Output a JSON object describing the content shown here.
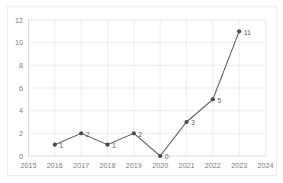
{
  "chart_data": {
    "type": "line",
    "title": "",
    "subtitle": "",
    "xlabel": "",
    "ylabel": "",
    "categories": [
      2016,
      2017,
      2018,
      2019,
      2020,
      2021,
      2022,
      2023
    ],
    "values": [
      1,
      2,
      1,
      2,
      0,
      3,
      5,
      11
    ],
    "point_labels": [
      "1",
      "2",
      "1",
      "2",
      "0",
      "3",
      "5",
      "11"
    ],
    "x_tick_labels": [
      "2015",
      "2016",
      "2017",
      "2018",
      "2019",
      "2020",
      "2021",
      "2022",
      "2023",
      "2024"
    ],
    "y_tick_labels": [
      "0",
      "2",
      "4",
      "6",
      "8",
      "10",
      "12"
    ],
    "xlim": [
      2015,
      2024
    ],
    "ylim": [
      0,
      12
    ],
    "y_tick_step": 2,
    "grid": {
      "horizontal": true,
      "vertical": true,
      "color": "#e6e6ea"
    },
    "legend": {
      "visible": false,
      "position": "none",
      "entries": []
    },
    "colors": {
      "background": "#ffffff",
      "line": "#606060",
      "marker": "#4c4c4c",
      "grid": "#e6e6ea",
      "axis": "#d2d2d6",
      "tick_text": "#7b7b7b",
      "label_text": "#5e5e5e",
      "frame": "#ededed"
    },
    "marker": {
      "shape": "circle",
      "radius": 2.1
    }
  }
}
